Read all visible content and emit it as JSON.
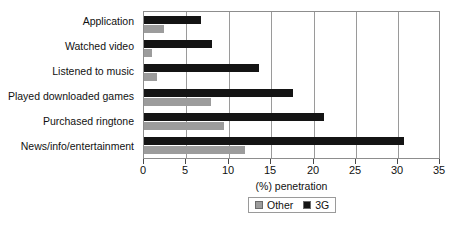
{
  "chart_data": {
    "type": "bar",
    "orientation": "horizontal",
    "title": "",
    "xlabel": "(%) penetration",
    "ylabel": "",
    "xlim": [
      0,
      35
    ],
    "xticks": [
      0,
      5,
      10,
      15,
      20,
      25,
      30,
      35
    ],
    "grid": "vertical",
    "legend_position": "bottom",
    "categories": [
      "Application",
      "Watched video",
      "Listened to music",
      "Played downloaded games",
      "Purchased ringtone",
      "News/info/entertainment"
    ],
    "series": [
      {
        "name": "3G",
        "color": "#141414",
        "values": [
          6.8,
          8.1,
          13.6,
          17.7,
          21.4,
          30.9
        ]
      },
      {
        "name": "Other",
        "color": "#9c9c9c",
        "values": [
          2.4,
          0.9,
          1.5,
          8.0,
          9.5,
          12.0
        ]
      }
    ]
  },
  "axis": {
    "title": "(%) penetration",
    "tick_labels": [
      "0",
      "5",
      "10",
      "15",
      "20",
      "25",
      "30",
      "35"
    ]
  },
  "legend": {
    "items": [
      {
        "label": "Other",
        "color": "#9c9c9c"
      },
      {
        "label": "3G",
        "color": "#141414"
      }
    ]
  },
  "categories": [
    "Application",
    "Watched video",
    "Listened to music",
    "Played downloaded games",
    "Purchased ringtone",
    "News/info/entertainment"
  ]
}
